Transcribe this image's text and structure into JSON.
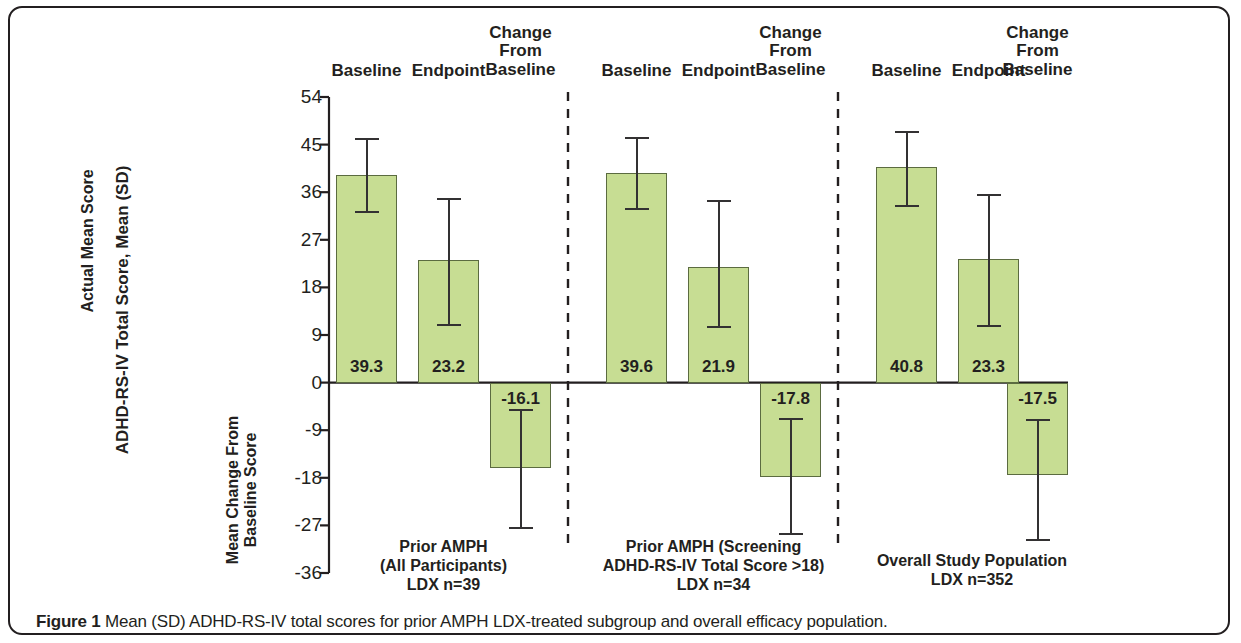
{
  "figure": {
    "caption_bold": "Figure 1",
    "caption_rest": " Mean (SD) ADHD-RS-IV total scores for prior AMPH LDX-treated subgroup and overall efficacy population."
  },
  "chart_data": {
    "type": "bar",
    "title": "",
    "ylabel": "ADHD-RS-IV Total Score, Mean (SD)",
    "ylabel_upper": "Actual Mean Score",
    "ylabel_lower": "Mean Change From\nBaseline Score",
    "xlabel": "",
    "ylim": [
      -36,
      54
    ],
    "yticks": [
      54,
      45,
      36,
      27,
      18,
      9,
      0,
      -9,
      -18,
      -27,
      -36
    ],
    "ytick_labels": [
      "54",
      "45",
      "36",
      "27",
      "18",
      "9",
      "0",
      "-9",
      "-18",
      "-27",
      "-36"
    ],
    "grid": false,
    "legend": "none",
    "bar_color": "#c7dd93",
    "bar_edge_color": "#5b6b40",
    "error_bar_color": "#333132",
    "categories": [
      "Baseline",
      "Endpoint",
      "Change From Baseline"
    ],
    "groups": [
      {
        "name": "Prior AMPH (All Participants)",
        "caption_lines": [
          "Prior AMPH",
          "(All Participants)",
          "LDX n=39"
        ],
        "bars": [
          {
            "category": "Baseline",
            "label": "Baseline",
            "value": 39.3,
            "value_label": "39.3",
            "sd_low": 32.5,
            "sd_high": 46.2
          },
          {
            "category": "Endpoint",
            "label": "Endpoint",
            "value": 23.2,
            "value_label": "23.2",
            "sd_low": 11.1,
            "sd_high": 34.9
          },
          {
            "category": "Change From Baseline",
            "label": "Change From Baseline",
            "value": -16.1,
            "value_label": "-16.1",
            "sd_low": -27.3,
            "sd_high": -5.0
          }
        ]
      },
      {
        "name": "Prior AMPH (Screening ADHD-RS-IV Total Score >18)",
        "caption_lines": [
          "Prior AMPH (Screening",
          "ADHD-RS-IV Total Score >18)",
          "LDX n=34"
        ],
        "bars": [
          {
            "category": "Baseline",
            "label": "Baseline",
            "value": 39.6,
            "value_label": "39.6",
            "sd_low": 33.0,
            "sd_high": 46.4
          },
          {
            "category": "Endpoint",
            "label": "Endpoint",
            "value": 21.9,
            "value_label": "21.9",
            "sd_low": 10.7,
            "sd_high": 34.6
          },
          {
            "category": "Change From Baseline",
            "label": "Change From Baseline",
            "value": -17.8,
            "value_label": "-17.8",
            "sd_low": -28.5,
            "sd_high": -6.7
          }
        ]
      },
      {
        "name": "Overall Study Population",
        "caption_lines": [
          "Overall Study Population",
          "LDX n=352"
        ],
        "bars": [
          {
            "category": "Baseline",
            "label": "Baseline",
            "value": 40.8,
            "value_label": "40.8",
            "sd_low": 33.5,
            "sd_high": 47.6
          },
          {
            "category": "Endpoint",
            "label": "Endpoint",
            "value": 23.3,
            "value_label": "23.3",
            "sd_low": 10.9,
            "sd_high": 35.6
          },
          {
            "category": "Change From Baseline",
            "label": "Change From Baseline",
            "value": -17.5,
            "value_label": "-17.5",
            "sd_low": -29.5,
            "sd_high": -6.8
          }
        ]
      }
    ],
    "column_headers": [
      {
        "lines": [
          "Baseline"
        ]
      },
      {
        "lines": [
          "Endpoint"
        ]
      },
      {
        "lines": [
          "Change",
          "From",
          "Baseline"
        ]
      }
    ]
  }
}
